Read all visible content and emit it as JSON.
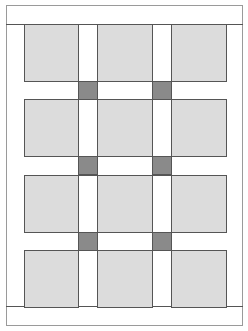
{
  "diagram": {
    "title": "",
    "type": "quilt-layout",
    "grid": {
      "columns": 3,
      "rows": 4
    },
    "colors": {
      "block": "#dcdcdc",
      "sashing": "#ffffff",
      "cornerstone": "#8a8a8a",
      "border": "#ffffff",
      "outline": "#555555"
    },
    "columns_x": [
      [
        24,
        78
      ],
      [
        97,
        152
      ],
      [
        171,
        226
      ]
    ],
    "rows_y": [
      [
        24,
        81
      ],
      [
        99,
        156
      ],
      [
        175,
        232
      ],
      [
        250,
        307
      ]
    ],
    "cornerstones": [
      {
        "x": 78,
        "y": 81
      },
      {
        "x": 152,
        "y": 81
      },
      {
        "x": 78,
        "y": 156
      },
      {
        "x": 152,
        "y": 156
      },
      {
        "x": 78,
        "y": 232
      },
      {
        "x": 152,
        "y": 232
      }
    ]
  }
}
